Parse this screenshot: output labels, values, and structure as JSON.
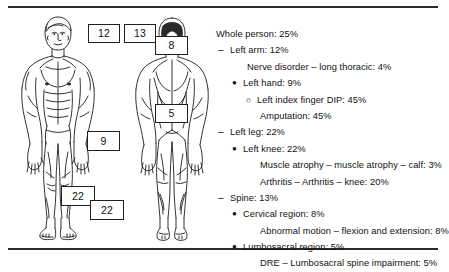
{
  "figures": {
    "anterior_label": "anterior-body-figure",
    "posterior_label": "posterior-body-figure"
  },
  "callouts": [
    {
      "id": "callout-12",
      "value": "12",
      "x": 88,
      "y": 24,
      "w": 30,
      "h": 17
    },
    {
      "id": "callout-13",
      "value": "13",
      "x": 124,
      "y": 24,
      "w": 30,
      "h": 17
    },
    {
      "id": "callout-8",
      "value": "8",
      "x": 155,
      "y": 36,
      "w": 31,
      "h": 17
    },
    {
      "id": "callout-5",
      "value": "5",
      "x": 155,
      "y": 104,
      "w": 31,
      "h": 17
    },
    {
      "id": "callout-9",
      "value": "9",
      "x": 87,
      "y": 131,
      "w": 31,
      "h": 18
    },
    {
      "id": "callout-22-knee",
      "value": "22",
      "x": 61,
      "y": 186,
      "w": 32,
      "h": 18
    },
    {
      "id": "callout-22-leg",
      "value": "22",
      "x": 90,
      "y": 200,
      "w": 32,
      "h": 18
    }
  ],
  "impairments": [
    {
      "marker": "",
      "level": 0,
      "text": "Whole person: 25%"
    },
    {
      "marker": "–",
      "level": 1,
      "text": "Left arm: 12%"
    },
    {
      "marker": "",
      "level": "1d",
      "text": "Nerve disorder – long thoracic: 4%"
    },
    {
      "marker": "●",
      "level": 2,
      "text": "Left hand: 9%"
    },
    {
      "marker": "○",
      "level": 3,
      "text": "Left index finger DIP: 45%"
    },
    {
      "marker": "",
      "level": "3d",
      "text": "Amputation: 45%"
    },
    {
      "marker": "–",
      "level": 1,
      "text": "Left leg: 22%"
    },
    {
      "marker": "●",
      "level": 2,
      "text": "Left knee: 22%"
    },
    {
      "marker": "",
      "level": "2d",
      "text": "Muscle atrophy – muscle atrophy – calf: 3%"
    },
    {
      "marker": "",
      "level": "2d",
      "text": "Arthritis – Arthritis – knee: 20%"
    },
    {
      "marker": "–",
      "level": 1,
      "text": "Spine: 13%"
    },
    {
      "marker": "●",
      "level": 2,
      "text": "Cervical region: 8%"
    },
    {
      "marker": "",
      "level": "2d",
      "text": "Abnormal motion – flexion and extension: 8%"
    },
    {
      "marker": "●",
      "level": 2,
      "text": "Lumbosacral region: 5%"
    },
    {
      "marker": "",
      "level": "2d",
      "text": "DRE – Lumbosacral spine impairment: 5%"
    }
  ],
  "colors": {
    "ink": "#1a1a1a",
    "rule": "#2b2b2b",
    "background": "#ffffff"
  }
}
